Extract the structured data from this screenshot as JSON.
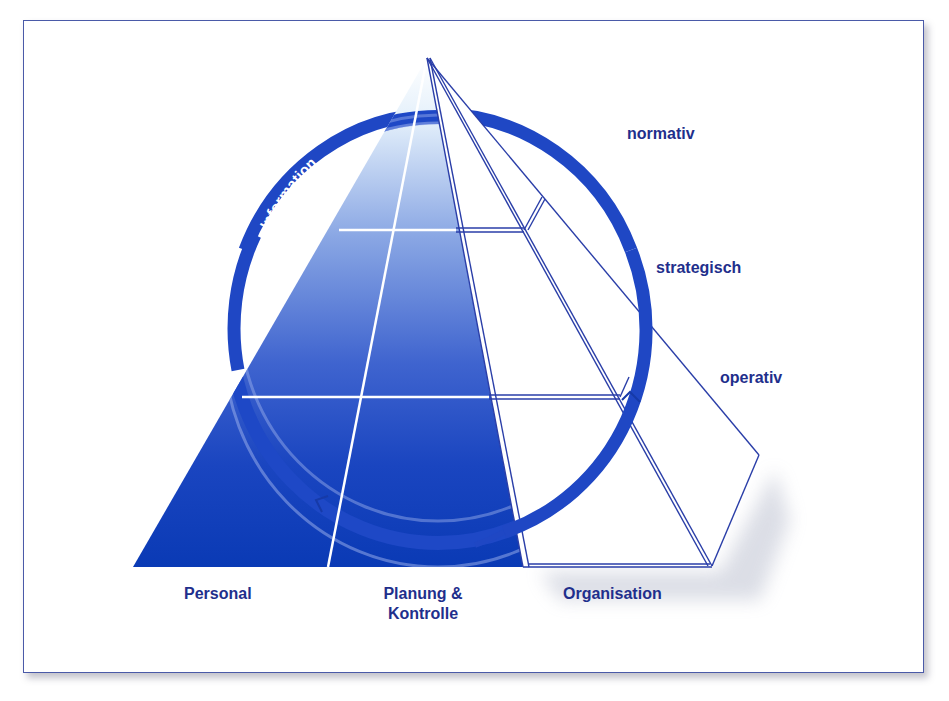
{
  "diagram": {
    "ring_label": "Information",
    "levels": [
      {
        "id": "normativ",
        "label": "normativ"
      },
      {
        "id": "strategisch",
        "label": "strategisch"
      },
      {
        "id": "operativ",
        "label": "operativ"
      }
    ],
    "bases": [
      {
        "id": "personal",
        "label": "Personal"
      },
      {
        "id": "planung",
        "label_line1": "Planung &",
        "label_line2": "Kontrolle"
      },
      {
        "id": "organisation",
        "label": "Organisation"
      }
    ],
    "colors": {
      "primary_blue": "#1f47c4",
      "deep_blue": "#0c3cb8",
      "label_navy": "#1f2f8c",
      "outline": "#2a3ea8",
      "frame_border": "#4a5aa8"
    }
  }
}
